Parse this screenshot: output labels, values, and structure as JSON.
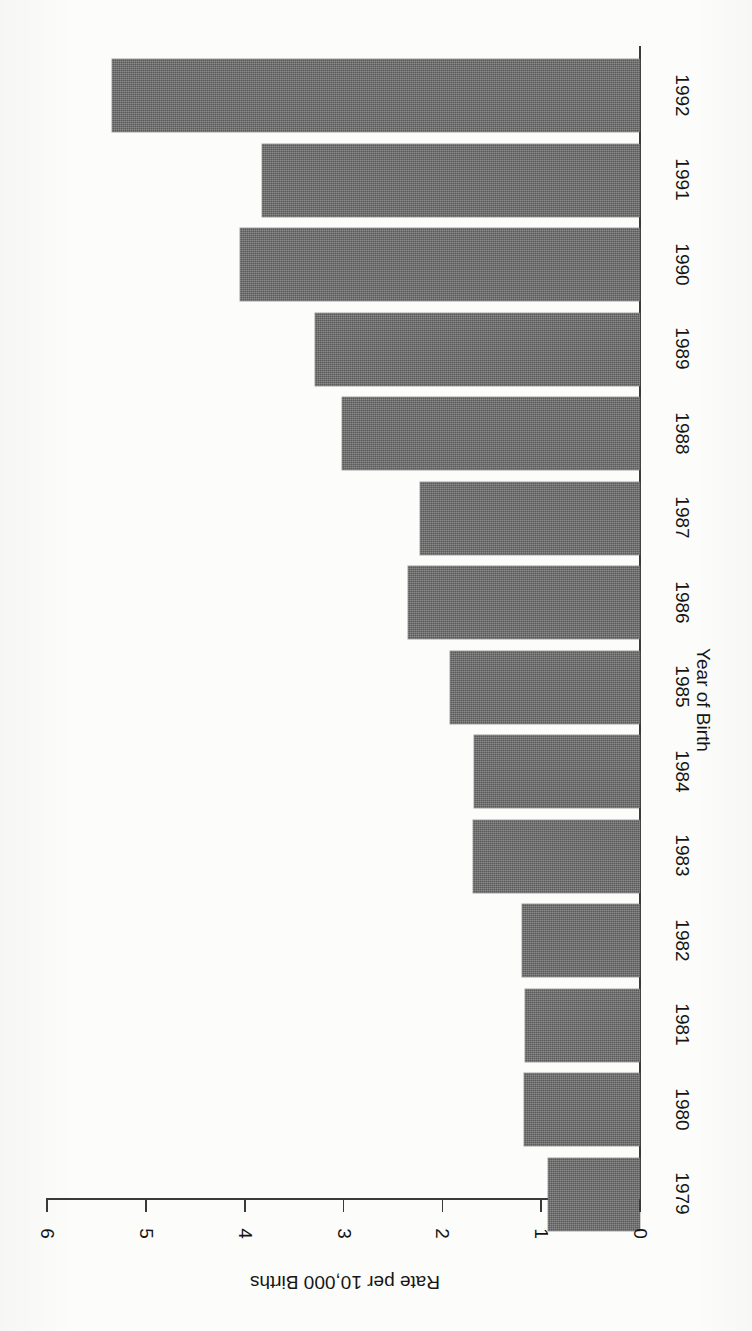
{
  "chart_data": {
    "type": "bar",
    "orientation": "horizontal-rotated",
    "title": "",
    "subtitle": "",
    "xlabel": "Year of Birth",
    "ylabel": "Rate per 10,000 Births",
    "categories": [
      "1979",
      "1980",
      "1981",
      "1982",
      "1983",
      "1984",
      "1985",
      "1986",
      "1987",
      "1988",
      "1989",
      "1990",
      "1991",
      "1992"
    ],
    "values": [
      0.93,
      1.17,
      1.16,
      1.19,
      1.69,
      1.68,
      1.92,
      2.35,
      2.23,
      3.02,
      3.29,
      4.05,
      3.83,
      5.34
    ],
    "series": [
      {
        "name": "Rate per 10,000 Births",
        "values": [
          0.93,
          1.17,
          1.16,
          1.19,
          1.69,
          1.68,
          1.92,
          2.35,
          2.23,
          3.02,
          3.29,
          4.05,
          3.83,
          5.34
        ]
      }
    ],
    "value_axis_ticks": [
      0,
      1,
      2,
      3,
      4,
      5,
      6
    ],
    "value_axis_tick_labels": [
      "0",
      "1",
      "2",
      "3",
      "4",
      "5",
      "6"
    ],
    "ylim": [
      0,
      6
    ],
    "grid": false,
    "legend": false,
    "legend_position": "none",
    "bar_color": "#6f6f6f",
    "axis_color": "#3a3a3a",
    "background_color": "#fcfcfa",
    "annotations": []
  },
  "figure": {
    "rotation_note": "chart rendered rotated 90 degrees on the page",
    "value_axis_label": "Rate per 10,000 Births",
    "category_axis_label": "Year of Birth"
  }
}
